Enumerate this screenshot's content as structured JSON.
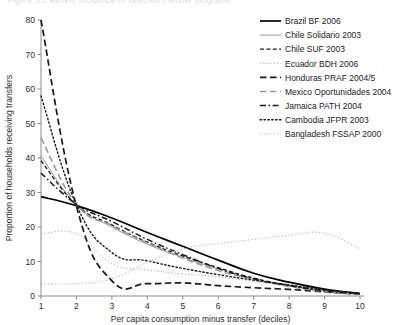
{
  "figure": {
    "title_fragment": "Figure 5.2    Benefit incidence of selected transfer programs"
  },
  "chart_data": {
    "type": "line",
    "title": "",
    "xlabel": "Per capita consumption minus transfer (deciles)",
    "ylabel": "Proportion of households receiving transfers",
    "x": [
      1,
      2,
      3,
      4,
      5,
      6,
      7,
      8,
      9,
      10
    ],
    "xticklabels": [
      "1",
      "2",
      "3",
      "4",
      "5",
      "6",
      "7",
      "8",
      "9",
      "10"
    ],
    "yticklabels": [
      "0",
      "10",
      "20",
      "30",
      "40",
      "50",
      "60",
      "70",
      "80"
    ],
    "xlim": [
      1,
      10
    ],
    "ylim": [
      0,
      80
    ],
    "grid": false,
    "legend_position": "top-right",
    "series": [
      {
        "name": "Brazil BF 2006",
        "style": "solid",
        "color": "#000000",
        "width": 1.7,
        "values": [
          28.8,
          26.2,
          22.6,
          18.4,
          14.4,
          10.4,
          6.6,
          4.0,
          2.0,
          0.7
        ]
      },
      {
        "name": "Chile Solidario 2003",
        "style": "solid-thin",
        "color": "#9a9a9a",
        "width": 1.0,
        "values": [
          40.6,
          26.4,
          20.0,
          15.0,
          11.2,
          7.8,
          5.0,
          3.0,
          1.4,
          0.5
        ]
      },
      {
        "name": "Chile SUF 2003",
        "style": "dash-short",
        "color": "#1a1a1a",
        "width": 1.3,
        "values": [
          39.2,
          26.4,
          20.6,
          15.6,
          11.6,
          8.2,
          5.2,
          3.1,
          1.5,
          0.6
        ]
      },
      {
        "name": "Ecuador BDH 2006",
        "style": "dot-fine",
        "color": "#a8a8a8",
        "width": 1.0,
        "values": [
          18.0,
          18.0,
          9.4,
          7.6,
          6.4,
          5.6,
          4.2,
          3.0,
          1.6,
          0.6
        ]
      },
      {
        "name": "Honduras PRAF 2004/5",
        "style": "dash-long",
        "color": "#1a1a1a",
        "width": 1.7,
        "values": [
          80.0,
          26.0,
          4.4,
          3.6,
          3.8,
          3.0,
          2.4,
          1.9,
          1.2,
          0.5
        ]
      },
      {
        "name": "Mexico Oportunidades 2004",
        "style": "dash-long",
        "color": "#9a9a9a",
        "width": 1.6,
        "values": [
          45.8,
          26.6,
          20.4,
          15.4,
          11.0,
          7.4,
          4.8,
          2.8,
          1.3,
          0.5
        ]
      },
      {
        "name": "Jamaica PATH 2004",
        "style": "dash-dot",
        "color": "#1a1a1a",
        "width": 1.5,
        "values": [
          35.6,
          26.6,
          21.6,
          16.4,
          12.0,
          8.0,
          5.0,
          3.0,
          1.5,
          0.6
        ]
      },
      {
        "name": "Cambodia JFPR 2003",
        "style": "dot-round",
        "color": "#1a1a1a",
        "width": 1.4,
        "values": [
          58.0,
          26.4,
          12.6,
          10.2,
          8.0,
          6.2,
          4.6,
          3.2,
          1.8,
          0.8
        ]
      },
      {
        "name": "Bangladesh FSSAP 2000",
        "style": "dot-fine",
        "color": "#b4b4b4",
        "width": 1.1,
        "values": [
          3.6,
          3.6,
          5.0,
          9.8,
          13.6,
          15.2,
          16.4,
          17.6,
          18.2,
          13.6
        ]
      }
    ]
  }
}
